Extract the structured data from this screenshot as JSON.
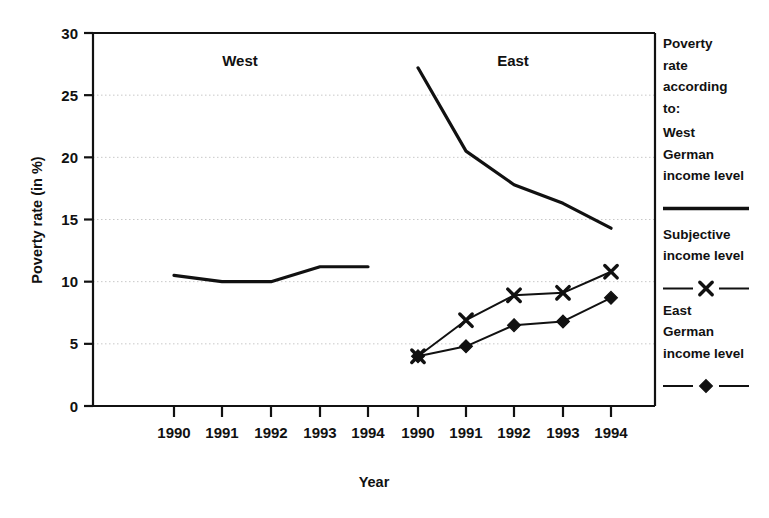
{
  "chart_data": {
    "type": "line",
    "title": "",
    "xlabel": "Year",
    "ylabel": "Poverty rate (in %)",
    "ylim": [
      0,
      30
    ],
    "yticks": [
      0,
      5,
      10,
      15,
      20,
      25,
      30
    ],
    "ytick_labels": [
      "0",
      "5",
      "10",
      "15",
      "20",
      "25",
      "30"
    ],
    "grid": true,
    "grid_style": "dotted-horizontal",
    "legend_position": "right",
    "panels": [
      {
        "name": "west",
        "title": "West",
        "categories": [
          "1990",
          "1991",
          "1992",
          "1993",
          "1994"
        ],
        "series": [
          {
            "name": "West German income level",
            "marker": "none",
            "line": "solid",
            "values": [
              10.5,
              10.0,
              10.0,
              11.2,
              11.2
            ]
          }
        ]
      },
      {
        "name": "east",
        "title": "East",
        "categories": [
          "1990",
          "1991",
          "1992",
          "1993",
          "1994"
        ],
        "series": [
          {
            "name": "West German income level",
            "marker": "none",
            "line": "solid",
            "values": [
              27.2,
              20.5,
              17.8,
              16.3,
              14.3
            ]
          },
          {
            "name": "Subjective income level",
            "marker": "x",
            "line": "solid",
            "values": [
              4.0,
              6.9,
              8.9,
              9.1,
              10.8
            ]
          },
          {
            "name": "East German income level",
            "marker": "diamond",
            "line": "solid",
            "values": [
              4.0,
              4.8,
              6.5,
              6.8,
              8.7
            ]
          }
        ]
      }
    ],
    "legend": {
      "heading_lines": [
        "Poverty",
        "rate",
        "according",
        "to:"
      ],
      "entries": [
        {
          "label_lines": [
            "West",
            "German",
            "income level"
          ],
          "marker": "none",
          "line": "solid"
        },
        {
          "label_lines": [
            "Subjective",
            "income level"
          ],
          "marker": "x",
          "line": "solid"
        },
        {
          "label_lines": [
            "East",
            "German",
            "income level"
          ],
          "marker": "diamond",
          "line": "solid"
        }
      ]
    },
    "colors": {
      "line": "#111111",
      "grid": "#c8c8c8",
      "axis": "#111111",
      "background": "#ffffff"
    }
  }
}
